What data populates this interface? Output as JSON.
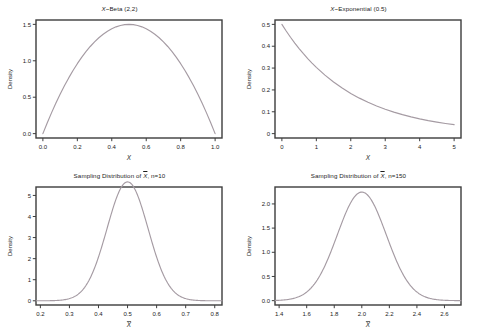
{
  "figure": {
    "background_color": "#ffffff",
    "curve_color": "#a59ba3",
    "frame_color": "#3d3d3d",
    "text_color": "#1c1c1c",
    "layout": "2x2 grid of density plots"
  },
  "chart_data": [
    {
      "id": "beta",
      "type": "line",
      "title": "X~Beta (2,2)",
      "title_prefix": "X",
      "title_rest": "~Beta (2,2)",
      "xlabel": "X",
      "ylabel": "Density",
      "xlim": [
        -0.04,
        1.04
      ],
      "ylim": [
        -0.06,
        1.56
      ],
      "xticks": [
        "0.0",
        "0.2",
        "0.4",
        "0.6",
        "0.8",
        "1.0"
      ],
      "xtick_values": [
        0.0,
        0.2,
        0.4,
        0.6,
        0.8,
        1.0
      ],
      "yticks": [
        "0.0",
        "0.5",
        "1.0",
        "1.5"
      ],
      "ytick_values": [
        0.0,
        0.5,
        1.0,
        1.5
      ],
      "grid": false,
      "legend": "none",
      "distribution": "Beta(2,2)",
      "peak": {
        "x": 0.5,
        "y": 1.5
      },
      "x": [
        0.0,
        0.025,
        0.05,
        0.075,
        0.1,
        0.125,
        0.15,
        0.175,
        0.2,
        0.225,
        0.25,
        0.275,
        0.3,
        0.325,
        0.35,
        0.375,
        0.4,
        0.425,
        0.45,
        0.475,
        0.5,
        0.525,
        0.55,
        0.575,
        0.6,
        0.625,
        0.65,
        0.675,
        0.7,
        0.725,
        0.75,
        0.775,
        0.8,
        0.825,
        0.85,
        0.875,
        0.9,
        0.925,
        0.95,
        0.975,
        1.0
      ],
      "y": [
        0.0,
        0.1463,
        0.285,
        0.4163,
        0.54,
        0.6563,
        0.765,
        0.8663,
        0.96,
        1.0463,
        1.125,
        1.1963,
        1.26,
        1.3163,
        1.365,
        1.4063,
        1.44,
        1.4663,
        1.485,
        1.4963,
        1.5,
        1.4963,
        1.485,
        1.4663,
        1.44,
        1.4063,
        1.365,
        1.3163,
        1.26,
        1.1963,
        1.125,
        1.0463,
        0.96,
        0.8663,
        0.765,
        0.6563,
        0.54,
        0.4163,
        0.285,
        0.1463,
        0.0
      ]
    },
    {
      "id": "exponential",
      "type": "line",
      "title": "X~Exponential (0.5)",
      "title_prefix": "X",
      "title_rest": "~Exponential (0.5)",
      "xlabel": "X",
      "ylabel": "Density",
      "xlim": [
        -0.2,
        5.2
      ],
      "ylim": [
        -0.02,
        0.52
      ],
      "xticks": [
        "0",
        "1",
        "2",
        "3",
        "4",
        "5"
      ],
      "xtick_values": [
        0,
        1,
        2,
        3,
        4,
        5
      ],
      "yticks": [
        "0",
        "0.1",
        "0.2",
        "0.3",
        "0.4",
        "0.5"
      ],
      "ytick_values": [
        0.0,
        0.1,
        0.2,
        0.3,
        0.4,
        0.5
      ],
      "grid": false,
      "legend": "none",
      "distribution": "Exponential(rate=0.5)",
      "peak": {
        "x": 0.0,
        "y": 0.5
      },
      "x": [
        0.0,
        0.125,
        0.25,
        0.375,
        0.5,
        0.625,
        0.75,
        0.875,
        1.0,
        1.25,
        1.5,
        1.75,
        2.0,
        2.25,
        2.5,
        2.75,
        3.0,
        3.25,
        3.5,
        3.75,
        4.0,
        4.25,
        4.5,
        4.75,
        5.0
      ],
      "y": [
        0.5,
        0.4697,
        0.4412,
        0.4144,
        0.3894,
        0.3658,
        0.3436,
        0.3228,
        0.3033,
        0.2677,
        0.2362,
        0.2085,
        0.184,
        0.1624,
        0.1433,
        0.1265,
        0.1116,
        0.0985,
        0.0869,
        0.0767,
        0.0677,
        0.0597,
        0.0527,
        0.0465,
        0.041
      ]
    },
    {
      "id": "sampling-n10",
      "type": "line",
      "title": "Sampling Distribution of X̄, n=10",
      "title_prefix": "Sampling Distribution of ",
      "title_xbar": "X",
      "title_rest": ", n=10",
      "xlabel": "X̄",
      "ylabel": "Density",
      "xlim": [
        0.185,
        0.825
      ],
      "ylim": [
        -0.2,
        5.4
      ],
      "xticks": [
        "0.2",
        "0.3",
        "0.4",
        "0.5",
        "0.6",
        "0.7",
        "0.8"
      ],
      "xtick_values": [
        0.2,
        0.3,
        0.4,
        0.5,
        0.6,
        0.7,
        0.8
      ],
      "yticks": [
        "0",
        "1",
        "2",
        "3",
        "4",
        "5"
      ],
      "ytick_values": [
        0,
        1,
        2,
        3,
        4,
        5
      ],
      "grid": false,
      "legend": "none",
      "distribution": "Normal(mean=0.5, sd=0.0707)",
      "peak": {
        "x": 0.5,
        "y": 5.2
      },
      "mean": 0.5,
      "sd": 0.0707,
      "n": 10
    },
    {
      "id": "sampling-n150",
      "type": "line",
      "title": "Sampling Distribution of X̄, n=150",
      "title_prefix": "Sampling Distribution of ",
      "title_xbar": "X",
      "title_rest": ", n=150",
      "xlabel": "X̄",
      "ylabel": "Density",
      "xlim": [
        1.37,
        2.72
      ],
      "ylim": [
        -0.09,
        2.35
      ],
      "xticks": [
        "1.4",
        "1.6",
        "1.8",
        "2.0",
        "2.2",
        "2.4",
        "2.6"
      ],
      "xtick_values": [
        1.4,
        1.6,
        1.8,
        2.0,
        2.2,
        2.4,
        2.6
      ],
      "yticks": [
        "0.0",
        "0.5",
        "1.0",
        "1.5",
        "2.0"
      ],
      "ytick_values": [
        0.0,
        0.5,
        1.0,
        1.5,
        2.0
      ],
      "grid": false,
      "legend": "none",
      "distribution": "Normal(mean=2.0, sd=0.1777)",
      "peak": {
        "x": 2.0,
        "y": 2.25
      },
      "mean": 2.0,
      "sd": 0.1777,
      "n": 150
    }
  ]
}
